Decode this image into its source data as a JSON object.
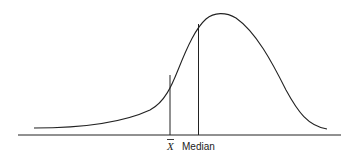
{
  "diagram": {
    "labels": {
      "mean": "X",
      "median": "Median"
    },
    "colors": {
      "stroke": "#222222",
      "background": "#ffffff"
    }
  }
}
